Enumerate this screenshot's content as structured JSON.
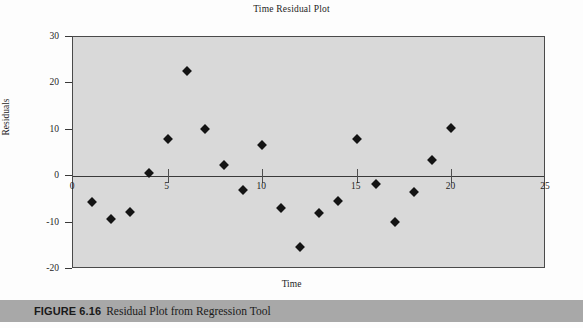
{
  "figure": {
    "caption_label": "FIGURE 6.16",
    "caption_title": "Residual Plot from Regression Tool",
    "caption_bar_color": "#a8a8a8"
  },
  "chart_data": {
    "type": "scatter",
    "title": "Time Residual Plot",
    "xlabel": "Time",
    "ylabel": "Residuals",
    "xlim": [
      0,
      25
    ],
    "ylim": [
      -20,
      30
    ],
    "xticks": [
      0,
      5,
      10,
      15,
      20,
      25
    ],
    "yticks": [
      -20,
      -10,
      0,
      10,
      20,
      30
    ],
    "xtick_labels": [
      "0",
      "5",
      "10",
      "15",
      "20",
      "25"
    ],
    "ytick_labels": [
      "-20",
      "-10",
      "0",
      "10",
      "20",
      "30"
    ],
    "grid": false,
    "legend": false,
    "zero_line": true,
    "plot_background": "#d9d9d9",
    "marker_color": "#141414",
    "marker_shape": "diamond",
    "x": [
      1,
      2,
      3,
      4,
      5,
      6,
      7,
      8,
      9,
      10,
      11,
      12,
      13,
      14,
      15,
      16,
      17,
      18,
      19,
      20
    ],
    "y": [
      -5.5,
      -9.2,
      -7.8,
      0.6,
      8.0,
      22.6,
      10.1,
      2.5,
      -2.9,
      6.7,
      -6.9,
      -15.3,
      -8.0,
      -5.4,
      8.0,
      -1.6,
      -9.9,
      -3.5,
      3.4,
      10.3
    ],
    "points": [
      {
        "x": 1,
        "y": -5.5
      },
      {
        "x": 2,
        "y": -9.2
      },
      {
        "x": 3,
        "y": -7.8
      },
      {
        "x": 4,
        "y": 0.6
      },
      {
        "x": 5,
        "y": 8.0
      },
      {
        "x": 6,
        "y": 22.6
      },
      {
        "x": 7,
        "y": 10.1
      },
      {
        "x": 8,
        "y": 2.5
      },
      {
        "x": 9,
        "y": -2.9
      },
      {
        "x": 10,
        "y": 6.7
      },
      {
        "x": 11,
        "y": -6.9
      },
      {
        "x": 12,
        "y": -15.3
      },
      {
        "x": 13,
        "y": -8.0
      },
      {
        "x": 14,
        "y": -5.4
      },
      {
        "x": 15,
        "y": 8.0
      },
      {
        "x": 16,
        "y": -1.6
      },
      {
        "x": 17,
        "y": -9.9
      },
      {
        "x": 18,
        "y": -3.5
      },
      {
        "x": 19,
        "y": 3.4
      },
      {
        "x": 20,
        "y": 10.3
      }
    ]
  }
}
